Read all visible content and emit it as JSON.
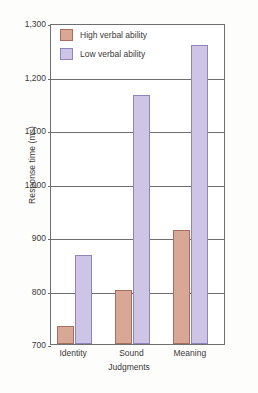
{
  "chart_data": {
    "type": "bar",
    "title": "",
    "xlabel": "Judgments",
    "ylabel": "Response time (ms)",
    "categories": [
      "Identity",
      "Sound",
      "Meaning"
    ],
    "series": [
      {
        "name": "High verbal ability",
        "values": [
          733,
          801,
          913
        ],
        "color": "#d8a795",
        "border_color": "#a6705c"
      },
      {
        "name": "Low verbal ability",
        "values": [
          866,
          1165,
          1258
        ],
        "color": "#cdc4e6",
        "border_color": "#8d85bb"
      }
    ],
    "ylim": [
      700,
      1300
    ],
    "ytick_labels": [
      "700",
      "800",
      "900",
      "1,000",
      "1,100",
      "1,200",
      "1,300"
    ],
    "ytick_values": [
      700,
      800,
      900,
      1000,
      1100,
      1200,
      1300
    ],
    "grid": true,
    "legend_position": "top-left"
  }
}
